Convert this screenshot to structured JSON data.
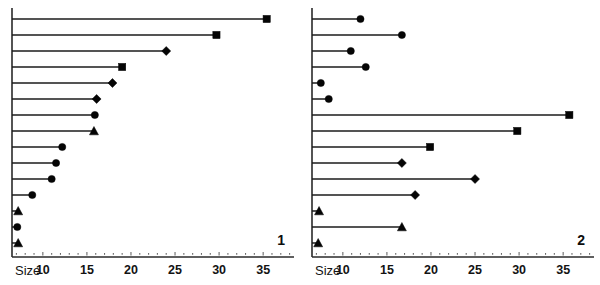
{
  "figure": {
    "width": 600,
    "height": 285,
    "background": "#ffffff",
    "ink_color": "#111111"
  },
  "chart_data": [
    {
      "type": "bar",
      "orientation": "horizontal",
      "style": "lollipop",
      "panel_label": "1",
      "title": "",
      "xlabel": "Size",
      "ylabel": "",
      "xlim": [
        6.5,
        38.5
      ],
      "ticks": [
        10,
        15,
        20,
        25,
        30,
        35
      ],
      "tick_labels": [
        "10",
        "15",
        "20",
        "25",
        "30",
        "35"
      ],
      "minor_ticks": [
        7,
        8,
        9,
        11,
        12,
        13,
        14,
        16,
        17,
        18,
        19,
        21,
        22,
        23,
        24,
        26,
        27,
        28,
        29,
        31,
        32,
        33,
        34,
        36,
        37,
        38
      ],
      "grid": false,
      "legend": "none",
      "categories": [
        "r1",
        "r2",
        "r3",
        "r4",
        "r5",
        "r6",
        "r7",
        "r8",
        "r9",
        "r10",
        "r11",
        "r12",
        "r13",
        "r14"
      ],
      "values": [
        35.4,
        29.7,
        24.0,
        19.0,
        17.9,
        16.1,
        15.9,
        15.8,
        12.2,
        11.5,
        11.0,
        8.8,
        7.2,
        7.1,
        7.2
      ],
      "markers": [
        "square",
        "square",
        "diamond",
        "square",
        "diamond",
        "diamond",
        "circle",
        "triangle",
        "circle",
        "circle",
        "circle",
        "circle",
        "triangle",
        "circle",
        "triangle"
      ]
    },
    {
      "type": "bar",
      "orientation": "horizontal",
      "style": "lollipop",
      "panel_label": "2",
      "title": "",
      "xlabel": "Size",
      "ylabel": "",
      "xlim": [
        6.5,
        38.5
      ],
      "ticks": [
        10,
        15,
        20,
        25,
        30,
        35
      ],
      "tick_labels": [
        "10",
        "15",
        "20",
        "25",
        "30",
        "35"
      ],
      "minor_ticks": [
        7,
        8,
        9,
        11,
        12,
        13,
        14,
        16,
        17,
        18,
        19,
        21,
        22,
        23,
        24,
        26,
        27,
        28,
        29,
        31,
        32,
        33,
        34,
        36,
        37,
        38
      ],
      "grid": false,
      "legend": "none",
      "categories": [
        "r1",
        "r2",
        "r3",
        "r4",
        "r5",
        "r6",
        "r7",
        "r8",
        "r9",
        "r10",
        "r11",
        "r12",
        "r13",
        "r14"
      ],
      "values": [
        12.0,
        16.7,
        10.9,
        12.6,
        7.5,
        8.4,
        35.7,
        29.8,
        19.9,
        16.7,
        25.0,
        18.2,
        7.3,
        16.7,
        7.2
      ],
      "markers": [
        "circle",
        "circle",
        "circle",
        "circle",
        "circle",
        "circle",
        "square",
        "square",
        "square",
        "diamond",
        "diamond",
        "diamond",
        "triangle",
        "triangle",
        "triangle"
      ]
    }
  ],
  "panels": [
    {
      "id": "panel-1",
      "label": "1",
      "axis_title": "Size"
    },
    {
      "id": "panel-2",
      "label": "2",
      "axis_title": "Size"
    }
  ]
}
